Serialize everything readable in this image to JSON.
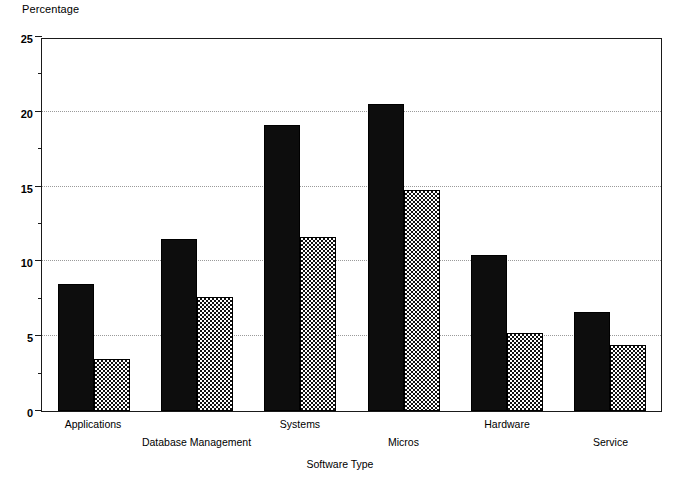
{
  "chart_data": {
    "type": "bar",
    "title": "",
    "ylabel": "Percentage",
    "xlabel": "Software Type",
    "categories": [
      "Applications",
      "Database Management",
      "Systems",
      "Micros",
      "Hardware",
      "Service"
    ],
    "series": [
      {
        "name": "series-1-solid",
        "pattern": "solid-black",
        "color": "#0d0d0d",
        "values": [
          8.5,
          11.5,
          19.1,
          20.5,
          10.4,
          6.6
        ]
      },
      {
        "name": "series-2-hatched",
        "pattern": "checkerboard",
        "color": "#111111",
        "values": [
          3.5,
          7.6,
          11.6,
          14.8,
          5.2,
          4.4
        ]
      }
    ],
    "ylim": [
      0,
      25
    ],
    "yticks": [
      0,
      5,
      10,
      15,
      20,
      25
    ],
    "ytick_labels": [
      "0",
      "5",
      "10",
      "15",
      "20",
      "25"
    ],
    "yminor_ticks": [
      2.5,
      7.5,
      12.5,
      17.5,
      22.5
    ],
    "grid": "horizontal-dotted-at-major-ticks",
    "legend": "none",
    "label_rows": [
      0,
      1,
      0,
      1,
      0,
      1
    ]
  },
  "axes": {
    "y_axis_title": "Percentage",
    "x_axis_title": "Software Type"
  }
}
